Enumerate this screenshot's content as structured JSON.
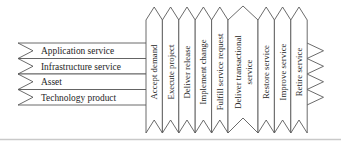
{
  "diagram": {
    "bands": {
      "items": [
        {
          "label": "Application service"
        },
        {
          "label": "Infrastructure service"
        },
        {
          "label": "Asset"
        },
        {
          "label": "Technology product"
        }
      ]
    },
    "ribbons": {
      "items": [
        {
          "label": "Accept demand"
        },
        {
          "label": "Execute project"
        },
        {
          "label": "Deliver release"
        },
        {
          "label": "Implement change"
        },
        {
          "label": "Fulfill service request"
        },
        {
          "label": "Deliver transactional service",
          "lines": [
            "Deliver transactional",
            "service"
          ]
        },
        {
          "label": "Restore service"
        },
        {
          "label": "Improve service"
        },
        {
          "label": "Retire service"
        }
      ]
    },
    "colors": {
      "stroke": "#5a5a5a",
      "text": "#262626",
      "background": "#ffffff",
      "divider": "#c9c9c9"
    }
  }
}
